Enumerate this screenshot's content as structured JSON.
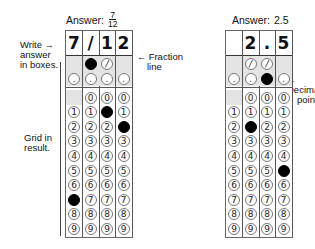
{
  "labels": {
    "write_answer": [
      "Write",
      "answer",
      "in boxes."
    ],
    "fraction_line": [
      "Fraction",
      "line"
    ],
    "decimal_point": [
      "Decimal",
      "point"
    ],
    "grid_in_result": [
      "Grid in",
      "result."
    ],
    "arrow_glyph": "←",
    "write_arrow_glyph": "→"
  },
  "examples": [
    {
      "title_prefix": "Answer:",
      "title_value": "",
      "title_fraction": {
        "numerator": "7",
        "denominator": "12"
      },
      "written": [
        "7",
        "/",
        "1",
        "2"
      ],
      "fraction_row": [
        "",
        "filled",
        "slash",
        ""
      ],
      "decimal_row": [
        "dot",
        "dot",
        "dot",
        "dot"
      ],
      "digit_filled": [
        7,
        null,
        1,
        2
      ],
      "has_zero": [
        false,
        true,
        true,
        true
      ]
    },
    {
      "title_prefix": "Answer:",
      "title_value": "2.5",
      "title_fraction": null,
      "written": [
        "",
        "2",
        ".",
        "5"
      ],
      "fraction_row": [
        "",
        "slash",
        "slash",
        ""
      ],
      "decimal_row": [
        "dot",
        "dot",
        "filled",
        "dot"
      ],
      "digit_filled": [
        null,
        2,
        null,
        5
      ],
      "has_zero": [
        false,
        true,
        true,
        true
      ]
    }
  ],
  "symbols": {
    "slash": "/",
    "dot": ".",
    "digits": [
      "0",
      "1",
      "2",
      "3",
      "4",
      "5",
      "6",
      "7",
      "8",
      "9"
    ]
  }
}
